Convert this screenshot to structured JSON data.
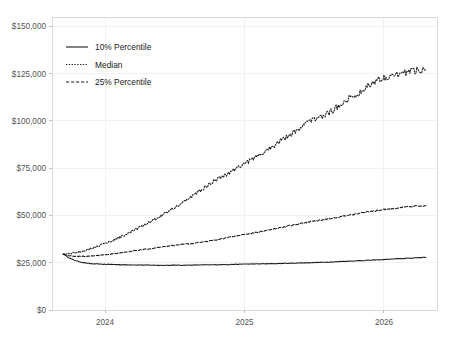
{
  "chart_data": {
    "type": "line",
    "title": "",
    "xlabel": "",
    "ylabel": "",
    "grid": true,
    "legend_position": "upper left",
    "xlim": [
      2023.62,
      2026.38
    ],
    "ylim": [
      0,
      155000
    ],
    "ytick_labels": [
      "$0",
      "$25,000",
      "$50,000",
      "$75,000",
      "$100,000",
      "$125,000",
      "$150,000"
    ],
    "ytick_values": [
      0,
      25000,
      50000,
      75000,
      100000,
      125000,
      150000
    ],
    "xtick_labels": [
      "2024",
      "2025",
      "2026"
    ],
    "xtick_values": [
      2024,
      2025,
      2026
    ],
    "series": [
      {
        "name": "10% Percentile",
        "linestyle": "solid",
        "color": "#1a1a1a",
        "x": [
          2023.7,
          2023.75,
          2023.8,
          2023.85,
          2023.9,
          2023.95,
          2024.0,
          2024.05,
          2024.1,
          2024.15,
          2024.2,
          2024.25,
          2024.3,
          2024.35,
          2024.4,
          2024.45,
          2024.5,
          2024.55,
          2024.6,
          2024.65,
          2024.7,
          2024.75,
          2024.8,
          2024.85,
          2024.9,
          2024.95,
          2025.0,
          2025.05,
          2025.1,
          2025.15,
          2025.2,
          2025.25,
          2025.3,
          2025.35,
          2025.4,
          2025.45,
          2025.5,
          2025.55,
          2025.6,
          2025.65,
          2025.7,
          2025.75,
          2025.8,
          2025.85,
          2025.9,
          2025.95,
          2026.0,
          2026.05,
          2026.1,
          2026.15,
          2026.2,
          2026.25,
          2026.3
        ],
        "values": [
          29500,
          27300,
          25900,
          25000,
          24500,
          24300,
          24200,
          24100,
          24000,
          23900,
          23850,
          23800,
          23750,
          23700,
          23650,
          23650,
          23700,
          23700,
          23750,
          23800,
          23850,
          23900,
          23950,
          24000,
          24100,
          24200,
          24300,
          24350,
          24400,
          24450,
          24500,
          24600,
          24700,
          24800,
          24900,
          25000,
          25100,
          25200,
          25350,
          25500,
          25700,
          25850,
          26000,
          26200,
          26350,
          26500,
          26700,
          26900,
          27100,
          27300,
          27500,
          27700,
          27900
        ]
      },
      {
        "name": "Median",
        "linestyle": "dotted",
        "color": "#1a1a1a",
        "x": [
          2023.7,
          2023.75,
          2023.8,
          2023.85,
          2023.9,
          2023.95,
          2024.0,
          2024.05,
          2024.1,
          2024.15,
          2024.2,
          2024.25,
          2024.3,
          2024.35,
          2024.4,
          2024.45,
          2024.5,
          2024.55,
          2024.6,
          2024.65,
          2024.7,
          2024.75,
          2024.8,
          2024.85,
          2024.9,
          2024.95,
          2025.0,
          2025.05,
          2025.1,
          2025.15,
          2025.2,
          2025.25,
          2025.3,
          2025.35,
          2025.4,
          2025.45,
          2025.5,
          2025.55,
          2025.6,
          2025.65,
          2025.7,
          2025.75,
          2025.8,
          2025.85,
          2025.9,
          2025.95,
          2026.0,
          2026.05,
          2026.1,
          2026.15,
          2026.2,
          2026.25,
          2026.3
        ],
        "values": [
          29500,
          29900,
          30600,
          31500,
          32600,
          33800,
          35200,
          36700,
          38300,
          40000,
          41800,
          43700,
          45700,
          47700,
          49800,
          52000,
          54300,
          56600,
          59000,
          61500,
          64000,
          66600,
          69200,
          71000,
          73000,
          75500,
          77500,
          79500,
          81500,
          84000,
          86500,
          89000,
          91500,
          94000,
          96500,
          99000,
          101000,
          102500,
          104000,
          106500,
          109500,
          112000,
          113500,
          116500,
          119500,
          121500,
          123000,
          124000,
          124500,
          125500,
          126500,
          127000,
          127500
        ]
      },
      {
        "name": "25% Percentile",
        "linestyle": "dashed",
        "color": "#1a1a1a",
        "x": [
          2023.7,
          2023.75,
          2023.8,
          2023.85,
          2023.9,
          2023.95,
          2024.0,
          2024.05,
          2024.1,
          2024.15,
          2024.2,
          2024.25,
          2024.3,
          2024.35,
          2024.4,
          2024.45,
          2024.5,
          2024.55,
          2024.6,
          2024.65,
          2024.7,
          2024.75,
          2024.8,
          2024.85,
          2024.9,
          2024.95,
          2025.0,
          2025.05,
          2025.1,
          2025.15,
          2025.2,
          2025.25,
          2025.3,
          2025.35,
          2025.4,
          2025.45,
          2025.5,
          2025.55,
          2025.6,
          2025.65,
          2025.7,
          2025.75,
          2025.8,
          2025.85,
          2025.9,
          2025.95,
          2026.0,
          2026.05,
          2026.1,
          2026.15,
          2026.2,
          2026.25,
          2026.3
        ],
        "values": [
          29500,
          28700,
          28400,
          28400,
          28600,
          28900,
          29300,
          29700,
          30200,
          30700,
          31200,
          31700,
          32200,
          32700,
          33200,
          33700,
          34200,
          34600,
          35000,
          35500,
          36000,
          36500,
          37200,
          37900,
          38600,
          39300,
          40000,
          40600,
          41200,
          41900,
          42600,
          43400,
          44200,
          45000,
          45700,
          46400,
          47100,
          47700,
          48200,
          48900,
          49600,
          50300,
          50900,
          51500,
          52100,
          52700,
          53200,
          53600,
          54000,
          54400,
          54700,
          55000,
          55300
        ]
      }
    ]
  },
  "legend": {
    "items": [
      {
        "label": "10% Percentile",
        "style": "solid"
      },
      {
        "label": "Median",
        "style": "dotted"
      },
      {
        "label": "25% Percentile",
        "style": "dashed"
      }
    ]
  }
}
